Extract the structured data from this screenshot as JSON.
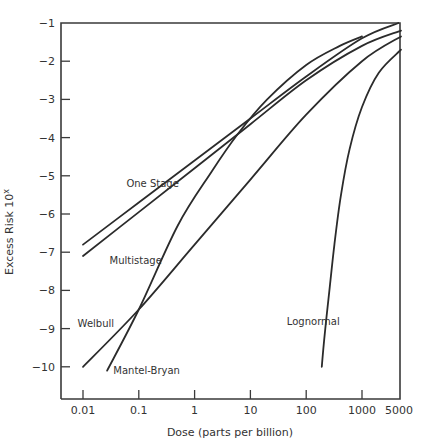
{
  "chart_data": {
    "type": "line",
    "title": "",
    "xlabel": "Dose (parts per billion)",
    "ylabel": "Excess Risk 10",
    "ylabel_superscript": "x",
    "xscale": "log",
    "xlim": [
      0.005,
      5000
    ],
    "ylim": [
      -10.8,
      -1
    ],
    "grid": false,
    "legend": "inline labels",
    "x_ticks": [
      {
        "value": 0.01,
        "label": "0.01"
      },
      {
        "value": 0.1,
        "label": "0.1"
      },
      {
        "value": 1,
        "label": "1"
      },
      {
        "value": 10,
        "label": "10"
      },
      {
        "value": 100,
        "label": "100"
      },
      {
        "value": 1000,
        "label": "1000"
      },
      {
        "value": 5000,
        "label": "5000"
      }
    ],
    "y_ticks": [
      {
        "value": -1,
        "label": "−1"
      },
      {
        "value": -2,
        "label": "−2"
      },
      {
        "value": -3,
        "label": "−3"
      },
      {
        "value": -4,
        "label": "−4"
      },
      {
        "value": -5,
        "label": "−5"
      },
      {
        "value": -6,
        "label": "−6"
      },
      {
        "value": -7,
        "label": "−7"
      },
      {
        "value": -8,
        "label": "−8"
      },
      {
        "value": -9,
        "label": "−9"
      },
      {
        "value": -10,
        "label": "−10"
      }
    ],
    "series": [
      {
        "name": "One Stage",
        "label_pos": {
          "x": 0.06,
          "y": -5.3
        },
        "points": [
          [
            0.01,
            -6.8
          ],
          [
            0.1,
            -5.7
          ],
          [
            1,
            -4.6
          ],
          [
            10,
            -3.5
          ],
          [
            100,
            -2.4
          ],
          [
            1000,
            -1.4
          ],
          [
            4500,
            -1.0
          ]
        ]
      },
      {
        "name": "Multistage",
        "label_pos": {
          "x": 0.03,
          "y": -7.3
        },
        "points": [
          [
            0.01,
            -7.1
          ],
          [
            0.1,
            -5.95
          ],
          [
            1,
            -4.8
          ],
          [
            10,
            -3.65
          ],
          [
            100,
            -2.5
          ],
          [
            1000,
            -1.6
          ],
          [
            5000,
            -1.2
          ]
        ]
      },
      {
        "name": "Welbull",
        "label_pos": {
          "x": 0.008,
          "y": -8.95
        },
        "points": [
          [
            0.01,
            -10.0
          ],
          [
            0.1,
            -8.5
          ],
          [
            1,
            -6.8
          ],
          [
            10,
            -5.1
          ],
          [
            100,
            -3.4
          ],
          [
            1000,
            -2.0
          ],
          [
            5000,
            -1.35
          ]
        ]
      },
      {
        "name": "Mantel-Bryan",
        "label_pos": {
          "x": 0.035,
          "y": -10.2
        },
        "points": [
          [
            0.027,
            -10.1
          ],
          [
            0.1,
            -8.5
          ],
          [
            0.5,
            -6.3
          ],
          [
            2,
            -4.9
          ],
          [
            6,
            -3.9
          ],
          [
            20,
            -3.0
          ],
          [
            100,
            -2.1
          ],
          [
            400,
            -1.6
          ],
          [
            1000,
            -1.35
          ]
        ]
      },
      {
        "name": "Lognormal",
        "label_pos": {
          "x": 45,
          "y": -8.9
        },
        "points": [
          [
            190,
            -10.0
          ],
          [
            220,
            -9.0
          ],
          [
            260,
            -8.0
          ],
          [
            320,
            -6.8
          ],
          [
            420,
            -5.5
          ],
          [
            600,
            -4.3
          ],
          [
            1000,
            -3.2
          ],
          [
            2000,
            -2.3
          ],
          [
            5000,
            -1.7
          ]
        ]
      }
    ]
  }
}
